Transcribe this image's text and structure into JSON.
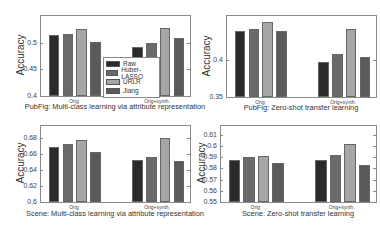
{
  "legend": {
    "items": [
      {
        "label": "Raw",
        "color": "#2a2a2a"
      },
      {
        "label": "Huber-LASSO",
        "color": "#6a6a6a"
      },
      {
        "label": "URLR",
        "color": "#a6a6a6"
      },
      {
        "label": "Jiang",
        "color": "#5a5a5a"
      }
    ]
  },
  "chart_data": [
    {
      "type": "bar",
      "title": "PubFig: Multi-class learning via attribute representation",
      "xlabel": "",
      "ylabel": "Accuracy",
      "ylim": [
        0.4,
        0.55
      ],
      "yticks": [
        "0.4",
        "0.45",
        "0.5"
      ],
      "categories": [
        "Orig",
        "Orig+synth."
      ],
      "series": [
        {
          "name": "Raw",
          "values": [
            0.515,
            0.491
          ]
        },
        {
          "name": "Huber-LASSO",
          "values": [
            0.517,
            0.499
          ]
        },
        {
          "name": "URLR",
          "values": [
            0.525,
            0.528
          ]
        },
        {
          "name": "Jiang",
          "values": [
            0.502,
            0.508
          ]
        }
      ],
      "legend_position": "center-inside"
    },
    {
      "type": "bar",
      "title": "PubFig: Zero-shot transfer learning",
      "xlabel": "",
      "ylabel": "Accuracy",
      "ylim": [
        0.35,
        0.46
      ],
      "yticks": [
        "0.35",
        "0.4"
      ],
      "categories": [
        "Orig",
        "Orig+synth."
      ],
      "series": [
        {
          "name": "Raw",
          "values": [
            0.439,
            0.397
          ]
        },
        {
          "name": "Huber-LASSO",
          "values": [
            0.442,
            0.409
          ]
        },
        {
          "name": "URLR",
          "values": [
            0.452,
            0.443
          ]
        },
        {
          "name": "Jiang",
          "values": [
            0.44,
            0.404
          ]
        }
      ]
    },
    {
      "type": "bar",
      "title": "Scene: Multi-class learning via attribute representation",
      "xlabel": "",
      "ylabel": "Accuracy",
      "ylim": [
        0.6,
        0.695
      ],
      "yticks": [
        "0.6",
        "0.62",
        "0.64",
        "0.66",
        "0.68"
      ],
      "categories": [
        "Orig",
        "Orig+synth."
      ],
      "series": [
        {
          "name": "Raw",
          "values": [
            0.669,
            0.652
          ]
        },
        {
          "name": "Huber-LASSO",
          "values": [
            0.673,
            0.656
          ]
        },
        {
          "name": "URLR",
          "values": [
            0.678,
            0.68
          ]
        },
        {
          "name": "Jiang",
          "values": [
            0.663,
            0.651
          ]
        }
      ]
    },
    {
      "type": "bar",
      "title": "Scene: Zero-shot transfer learning",
      "xlabel": "",
      "ylabel": "Accuracy",
      "ylim": [
        0.55,
        0.618
      ],
      "yticks": [
        "0.55",
        "0.56",
        "0.57",
        "0.58",
        "0.59",
        "0.6",
        "0.61"
      ],
      "categories": [
        "Orig",
        "Orig+synth."
      ],
      "series": [
        {
          "name": "Raw",
          "values": [
            0.588,
            0.588
          ]
        },
        {
          "name": "Huber-LASSO",
          "values": [
            0.59,
            0.592
          ]
        },
        {
          "name": "URLR",
          "values": [
            0.591,
            0.602
          ]
        },
        {
          "name": "Jiang",
          "values": [
            0.585,
            0.583
          ]
        }
      ]
    }
  ]
}
